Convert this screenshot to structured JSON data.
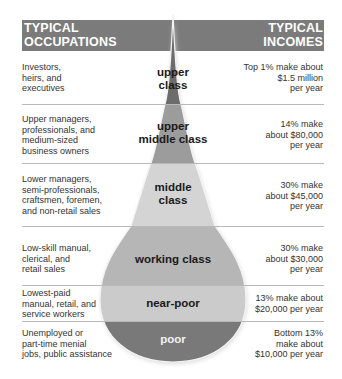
{
  "header": {
    "occupations_title_line1": "TYPICAL",
    "occupations_title_line2": "OCCUPATIONS",
    "incomes_title_line1": "TYPICAL",
    "incomes_title_line2": "INCOMES"
  },
  "colors": {
    "header_bar": "#7b7b7b",
    "upper_class": "#6c6c6c",
    "upper_middle_class": "#9c9c9c",
    "middle_class": "#d4d4d4",
    "working_class": "#b6b6b6",
    "near_poor": "#cbcbcb",
    "poor": "#797979"
  },
  "classes": [
    {
      "name_line1": "upper",
      "name_line2": "class",
      "occupations": [
        "Investors,",
        "heirs, and",
        "executives"
      ],
      "income": [
        "Top 1% make about",
        "$1.5 million",
        "per year"
      ]
    },
    {
      "name_line1": "upper",
      "name_line2": "middle class",
      "occupations": [
        "Upper managers,",
        "professionals, and",
        "medium-sized",
        "business owners"
      ],
      "income": [
        "14% make",
        "about $80,000",
        "per year"
      ]
    },
    {
      "name_line1": "middle",
      "name_line2": "class",
      "occupations": [
        "Lower managers,",
        "semi-professionals,",
        "craftsmen, foremen,",
        "and non-retail sales"
      ],
      "income": [
        "30% make",
        "about $45,000",
        "per year"
      ]
    },
    {
      "name_line1": "working class",
      "name_line2": "",
      "occupations": [
        "Low-skill manual,",
        "clerical, and",
        "retail sales"
      ],
      "income": [
        "30% make",
        "about $30,000",
        "per year"
      ]
    },
    {
      "name_line1": "near-poor",
      "name_line2": "",
      "occupations": [
        "Lowest-paid",
        "manual, retail, and",
        "service workers"
      ],
      "income": [
        "13% make about",
        "$20,000 per year"
      ]
    },
    {
      "name_line1": "poor",
      "name_line2": "",
      "occupations": [
        "Unemployed or",
        "part-time menial",
        "jobs, public assistance"
      ],
      "income": [
        "Bottom 13%",
        "make about",
        "$10,000 per year"
      ]
    }
  ]
}
